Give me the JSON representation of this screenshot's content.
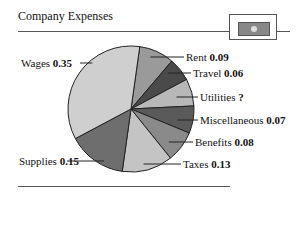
{
  "header": {
    "title": "Company Expenses",
    "icon": "dollar-bill-icon"
  },
  "chart_data": {
    "type": "pie",
    "title": "Company Expenses",
    "categories": [
      "Rent",
      "Travel",
      "Utilities",
      "Miscellaneous",
      "Benefits",
      "Taxes",
      "Supplies",
      "Wages"
    ],
    "values": [
      0.09,
      0.06,
      0.07,
      0.07,
      0.08,
      0.13,
      0.15,
      0.35
    ],
    "value_labels": [
      "0.09",
      "0.06",
      "?",
      "0.07",
      "0.08",
      "0.13",
      "0.15",
      "0.35"
    ],
    "colors": [
      "#9a9a9a",
      "#4a4a4a",
      "#b8b8b8",
      "#5a5a5a",
      "#8a8a8a",
      "#c4c4c4",
      "#6e6e6e",
      "#cfcfcf"
    ],
    "unknown_slice": "Utilities"
  },
  "labels": [
    {
      "name": "Rent",
      "value": "0.09"
    },
    {
      "name": "Travel",
      "value": "0.06"
    },
    {
      "name": "Utilities",
      "value": "?"
    },
    {
      "name": "Miscellaneous",
      "value": "0.07"
    },
    {
      "name": "Benefits",
      "value": "0.08"
    },
    {
      "name": "Taxes",
      "value": "0.13"
    },
    {
      "name": "Supplies",
      "value": "0.15"
    },
    {
      "name": "Wages",
      "value": "0.35"
    }
  ]
}
